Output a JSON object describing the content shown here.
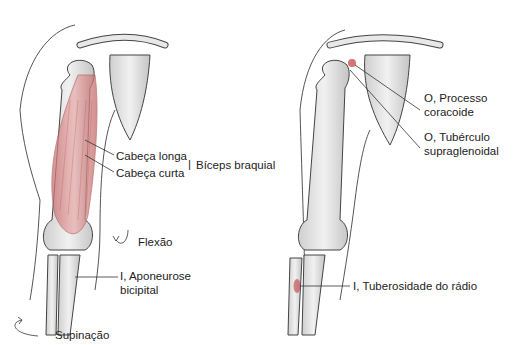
{
  "left_figure": {
    "labels": {
      "long_head": "Cabeça longa",
      "short_head": "Cabeça curta",
      "muscle": "Bíceps braquial",
      "flexion": "Flexão",
      "insertion_line1": "I, Aponeurose",
      "insertion_line2": "bicipital",
      "supination": "Supinação"
    }
  },
  "right_figure": {
    "labels": {
      "origin1_line1": "O, Processo",
      "origin1_line2": "coracoide",
      "origin2_line1": "O, Tubérculo",
      "origin2_line2": "supraglenoidal",
      "insertion": "I, Tuberosidade do rádio"
    }
  },
  "colors": {
    "bone": "#e6e6e6",
    "bone_shade": "#bdbdbd",
    "outline": "#444444",
    "muscle": "#d98c8c",
    "highlight": "#c0393b"
  }
}
